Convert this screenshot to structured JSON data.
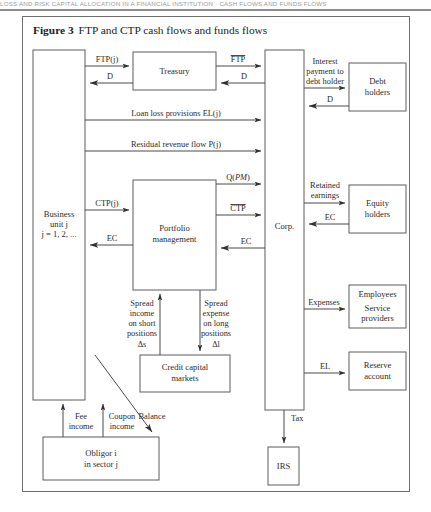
{
  "running_head": "LOSS  AND  RISK  CAPITAL  ALLOCATION  IN  A  FINANCIAL  INSTITUTION  ·  CASH  FLOWS  AND  FUNDS  FLOWS",
  "caption": {
    "label": "Figure 3",
    "text": "FTP and CTP cash flows and funds flows"
  },
  "nodes": {
    "business_unit": {
      "line1": "Business",
      "line2": "unit j",
      "line3": "j = 1, 2, ..."
    },
    "treasury": {
      "line1": "Treasury"
    },
    "portfolio_management": {
      "line1": "Portfolio",
      "line2": "management"
    },
    "corp": {
      "line1": "Corp."
    },
    "debt_holders": {
      "line1": "Debt",
      "line2": "holders"
    },
    "equity_holders": {
      "line1": "Equity",
      "line2": "holders"
    },
    "employees": {
      "line1": "Employees",
      "line2": "Service",
      "line3": "providers"
    },
    "reserve_account": {
      "line1": "Reserve",
      "line2": "account"
    },
    "credit_capital_markets": {
      "line1": "Credit capital",
      "line2": "markets"
    },
    "obligor": {
      "line1": "Obligor i",
      "line2": "in sector j"
    },
    "irs": {
      "line1": "IRS"
    }
  },
  "edges": {
    "ftp_j": "FTP(j)",
    "d_treasury_to_bu": "D",
    "ftp_bar": "FTP",
    "d_corp_to_treasury": "D",
    "loan_loss_provisions": "Loan loss provisions EL(j)",
    "residual_revenue_flow": "Residual revenue flow P(j)",
    "interest_payment": {
      "line1": "Interest",
      "line2": "payment to",
      "line3": "debt holder"
    },
    "d_debt_to_corp": "D",
    "ctp_j": "CTP(j)",
    "q_pm": "Q(PM)",
    "ctp_bar": "CTP",
    "ec_pm_to_bu": "EC",
    "ec_corp_to_pm": "EC",
    "retained_earnings": {
      "line1": "Retained",
      "line2": "earnings"
    },
    "ec_equity_to_corp": "EC",
    "expenses": "Expenses",
    "el_reserve": "EL",
    "spread_income": {
      "line1": "Spread",
      "line2": "income",
      "line3": "on short",
      "line4": "positions",
      "line5": "Δs"
    },
    "spread_expense": {
      "line1": "Spread",
      "line2": "expense",
      "line3": "on long",
      "line4": "positions",
      "line5": "Δl"
    },
    "fee_income": {
      "line1": "Fee",
      "line2": "income"
    },
    "coupon_income": {
      "line1": "Coupon",
      "line2": "income"
    },
    "balance": "Balance",
    "tax": "Tax"
  },
  "colors": {
    "frame": "#6f6f6f",
    "box_stroke": "#5d5d5d",
    "arrow": "#4a4a4a",
    "text": "#2b2b2b",
    "page_bg": "#ffffff"
  }
}
